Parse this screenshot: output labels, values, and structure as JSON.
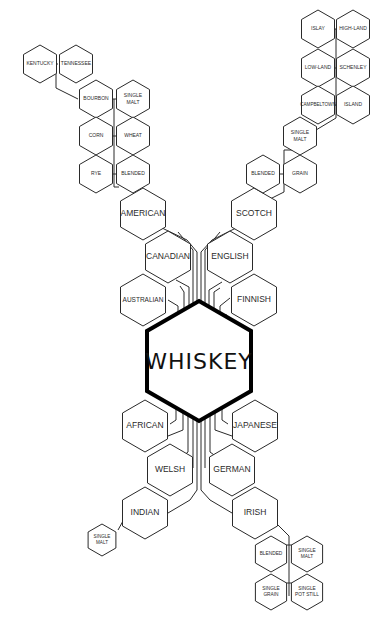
{
  "diagram": {
    "title": "WHISKEY",
    "center": {
      "label": "WHISKEY",
      "cx": 199,
      "cy": 361,
      "r": 60
    },
    "colors": {
      "stroke": "#2a2a2a",
      "center_stroke": "#000000",
      "background": "#ffffff"
    },
    "nodes": [
      {
        "id": "american",
        "label": [
          "AMERICAN"
        ],
        "cx": 143,
        "cy": 214,
        "r": 26,
        "fs": 8.5
      },
      {
        "id": "canadian",
        "label": [
          "CANADIAN"
        ],
        "cx": 168,
        "cy": 257,
        "r": 26,
        "fs": 8.5
      },
      {
        "id": "australian",
        "label": [
          "AUSTRALIAN"
        ],
        "cx": 143,
        "cy": 300,
        "r": 26,
        "fs": 6.5
      },
      {
        "id": "scotch",
        "label": [
          "SCOTCH"
        ],
        "cx": 254,
        "cy": 214,
        "r": 26,
        "fs": 8.5
      },
      {
        "id": "english",
        "label": [
          "ENGLISH"
        ],
        "cx": 230,
        "cy": 257,
        "r": 26,
        "fs": 8.5
      },
      {
        "id": "finnish",
        "label": [
          "FINNISH"
        ],
        "cx": 254,
        "cy": 300,
        "r": 26,
        "fs": 8.5
      },
      {
        "id": "african",
        "label": [
          "AFRICAN"
        ],
        "cx": 145,
        "cy": 426,
        "r": 26,
        "fs": 8.5
      },
      {
        "id": "welsh",
        "label": [
          "WELSH"
        ],
        "cx": 170,
        "cy": 470,
        "r": 26,
        "fs": 8.5
      },
      {
        "id": "indian",
        "label": [
          "INDIAN"
        ],
        "cx": 145,
        "cy": 513,
        "r": 26,
        "fs": 8.5
      },
      {
        "id": "japanese",
        "label": [
          "JAPANESE"
        ],
        "cx": 255,
        "cy": 426,
        "r": 26,
        "fs": 8.5
      },
      {
        "id": "german",
        "label": [
          "GERMAN"
        ],
        "cx": 232,
        "cy": 470,
        "r": 26,
        "fs": 8.5
      },
      {
        "id": "irish",
        "label": [
          "IRISH"
        ],
        "cx": 255,
        "cy": 513,
        "r": 26,
        "fs": 8.5
      },
      {
        "id": "kentucky",
        "label": [
          "KENTUCKY"
        ],
        "cx": 40,
        "cy": 64,
        "r": 19,
        "fs": 5
      },
      {
        "id": "tennessee",
        "label": [
          "TENNESSEE"
        ],
        "cx": 76,
        "cy": 64,
        "r": 19,
        "fs": 5
      },
      {
        "id": "bourbon",
        "label": [
          "BOURBON"
        ],
        "cx": 96,
        "cy": 99,
        "r": 19,
        "fs": 5
      },
      {
        "id": "us-single-malt",
        "label": [
          "SINGLE",
          "MALT"
        ],
        "cx": 133,
        "cy": 99,
        "r": 19,
        "fs": 5
      },
      {
        "id": "corn",
        "label": [
          "CORN"
        ],
        "cx": 96,
        "cy": 136,
        "r": 19,
        "fs": 5
      },
      {
        "id": "wheat",
        "label": [
          "WHEAT"
        ],
        "cx": 133,
        "cy": 136,
        "r": 19,
        "fs": 5
      },
      {
        "id": "rye",
        "label": [
          "RYE"
        ],
        "cx": 96,
        "cy": 174,
        "r": 19,
        "fs": 5
      },
      {
        "id": "us-blended",
        "label": [
          "BLENDED"
        ],
        "cx": 133,
        "cy": 174,
        "r": 19,
        "fs": 5
      },
      {
        "id": "islay",
        "label": [
          "ISLAY"
        ],
        "cx": 318,
        "cy": 29,
        "r": 19,
        "fs": 5
      },
      {
        "id": "highland",
        "label": [
          "HIGH-LAND"
        ],
        "cx": 353,
        "cy": 29,
        "r": 19,
        "fs": 5
      },
      {
        "id": "lowland",
        "label": [
          "LOW-LAND"
        ],
        "cx": 318,
        "cy": 68,
        "r": 19,
        "fs": 5
      },
      {
        "id": "schenley",
        "label": [
          "SCHENLEY"
        ],
        "cx": 353,
        "cy": 68,
        "r": 19,
        "fs": 5
      },
      {
        "id": "campbeltown",
        "label": [
          "CAMPBELTOWN"
        ],
        "cx": 318,
        "cy": 105,
        "r": 19,
        "fs": 4.6
      },
      {
        "id": "island",
        "label": [
          "ISLAND"
        ],
        "cx": 353,
        "cy": 105,
        "r": 19,
        "fs": 5
      },
      {
        "id": "sc-single-malt",
        "label": [
          "SINGLE",
          "MALT"
        ],
        "cx": 300,
        "cy": 136,
        "r": 19,
        "fs": 5
      },
      {
        "id": "sc-blended",
        "label": [
          "BLENDED"
        ],
        "cx": 263,
        "cy": 174,
        "r": 19,
        "fs": 5
      },
      {
        "id": "grain",
        "label": [
          "GRAIN"
        ],
        "cx": 300,
        "cy": 174,
        "r": 19,
        "fs": 5
      },
      {
        "id": "in-single-malt",
        "label": [
          "SINGLE",
          "MALT"
        ],
        "cx": 102,
        "cy": 540,
        "r": 16,
        "fs": 4.6
      },
      {
        "id": "ir-blended",
        "label": [
          "BLENDED"
        ],
        "cx": 271,
        "cy": 554,
        "r": 18,
        "fs": 4.8
      },
      {
        "id": "ir-single-malt",
        "label": [
          "SINGLE",
          "MALT"
        ],
        "cx": 307,
        "cy": 554,
        "r": 18,
        "fs": 4.8
      },
      {
        "id": "single-grain",
        "label": [
          "SINGLE",
          "GRAIN"
        ],
        "cx": 271,
        "cy": 592,
        "r": 18,
        "fs": 4.8
      },
      {
        "id": "single-pot-still",
        "label": [
          "SINGLE",
          "POT STILL"
        ],
        "cx": 307,
        "cy": 592,
        "r": 18,
        "fs": 4.8
      }
    ],
    "connectors": [
      "M197 302 L197 252 L187 240 L162 228",
      "M193 306 L193 250 L178 232",
      "M189 311 L189 287 L176 280",
      "M184 314 L184 292 L180 286",
      "M178 318 L178 306 L168 300",
      "M173 321 L173 318",
      "M201 302 L201 252 L212 240 L236 228",
      "M205 305 L205 250 L220 232",
      "M209 308 L209 290 L222 282",
      "M214 311 L214 292 L220 288",
      "M220 314 L220 306 L230 298",
      "M226 318 L226 314",
      "M197 420 L197 490 L190 500 L168 513",
      "M201 420 L201 490 L210 500 L232 513",
      "M193 417 L193 468",
      "M205 417 L205 468",
      "M188 413 L188 452 L168 468",
      "M210 413 L210 452 L232 468",
      "M183 410 L183 430 L168 436",
      "M215 410 L215 430 L232 436",
      "M176 405 L176 420 L170 424",
      "M222 405 L222 420 L228 424",
      "M119 187 L114 187 L114 99 L112 99",
      "M114 99 L116 99",
      "M114 136 L112 136",
      "M114 136 L116 136",
      "M114 174 L112 174",
      "M114 174 L116 174",
      "M58 64 L56 64 L56 88 L78 99",
      "M296 150 L284 150 L284 192 L268 200",
      "M284 174 L280 174",
      "M284 174 L283 174",
      "M316 130 L336 118 L336 29 L334 29",
      "M336 29 L339 29",
      "M336 68 L334 68",
      "M336 68 L337 68",
      "M336 105 L334 105",
      "M336 105 L337 105",
      "M123 521 L118 530",
      "M276 523 L289 536 L289 596",
      "M289 545 L280 545",
      "M289 545 L297 545",
      "M289 583 L280 583",
      "M289 583 L297 583"
    ]
  }
}
